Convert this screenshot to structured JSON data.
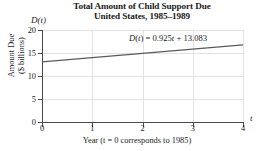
{
  "chart_data": {
    "type": "line",
    "title": "Total Amount of Child Support Due\nUnited States, 1985–1989",
    "title_line1": "Total Amount of Child Support Due",
    "title_line2": "United States, 1985–1989",
    "xlabel": "Year (t = 0 corresponds to 1985)",
    "ylabel_line1": "Amount Due",
    "ylabel_line2": "($ billions)",
    "y_axis_name": "D(t)",
    "x_axis_name": "t",
    "xlim": [
      0,
      4
    ],
    "ylim": [
      0,
      20
    ],
    "xticks": [
      0,
      1,
      2,
      3,
      4
    ],
    "xtick_labels": [
      "0",
      "1",
      "2",
      "3",
      "4"
    ],
    "yticks": [
      0,
      5,
      10,
      15,
      20
    ],
    "ytick_labels": [
      "0",
      "5",
      "10",
      "15",
      "20"
    ],
    "grid": "both-light",
    "legend": "none",
    "annotation": "D(t) = 0.925t + 13.083",
    "equation": {
      "function_name": "D",
      "variable": "t",
      "slope": 0.925,
      "intercept": 13.083
    },
    "series": [
      {
        "name": "D(t) = 0.925t + 13.083",
        "x": [
          0,
          1,
          2,
          3,
          4
        ],
        "values": [
          13.083,
          14.008,
          14.933,
          15.858,
          16.783
        ],
        "color": "#5a5a5a"
      }
    ]
  },
  "colors": {
    "line": "#5a5a5a",
    "axis": "#4a4a4a",
    "grid": "#e2e2e2",
    "text": "#1a1a1a",
    "background": "#ffffff"
  }
}
